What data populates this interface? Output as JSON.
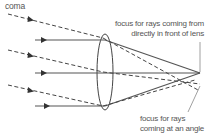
{
  "labels": {
    "coma": "coma",
    "focus_front_line1": "focus for rays coming from",
    "focus_front_line2": "directly in front of lens",
    "focus_angle_line1": "focus for rays",
    "focus_angle_line2": "coming at an angle"
  },
  "diagram": {
    "lens": {
      "cx": 105,
      "cy": 72,
      "rx": 9,
      "ry": 37
    },
    "solid_rays_y": [
      40,
      73,
      106
    ],
    "dashed_rays_start_y": [
      14,
      50,
      85
    ],
    "focus_front": {
      "x": 200,
      "y": 73
    },
    "focus_angle": {
      "x": 200,
      "y": 84
    },
    "colors": {
      "line": "#444444",
      "text": "#555555",
      "background": "#ffffff"
    }
  }
}
